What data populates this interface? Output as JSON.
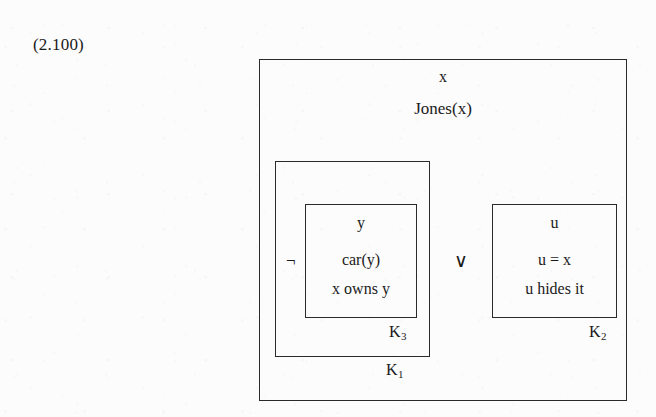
{
  "equation": {
    "number": "(2.100)"
  },
  "diagram": {
    "type": "discourse-representation-structure",
    "outer_box": {
      "universe": "x",
      "conditions": [
        "Jones(x)"
      ]
    },
    "operators": {
      "negation": "¬",
      "disjunction": "∨"
    },
    "k1": {
      "label_base": "K",
      "label_sub": "1",
      "universe": "",
      "conditions": []
    },
    "k3": {
      "label_base": "K",
      "label_sub": "3",
      "universe": "y",
      "conditions": [
        "car(y)",
        "x owns y"
      ]
    },
    "k2": {
      "label_base": "K",
      "label_sub": "2",
      "universe": "u",
      "conditions": [
        "u = x",
        "u hides it"
      ]
    }
  },
  "colors": {
    "ink": "#1a1a1a",
    "rule": "#2a2a2a",
    "paper": "#fcfcfc"
  }
}
